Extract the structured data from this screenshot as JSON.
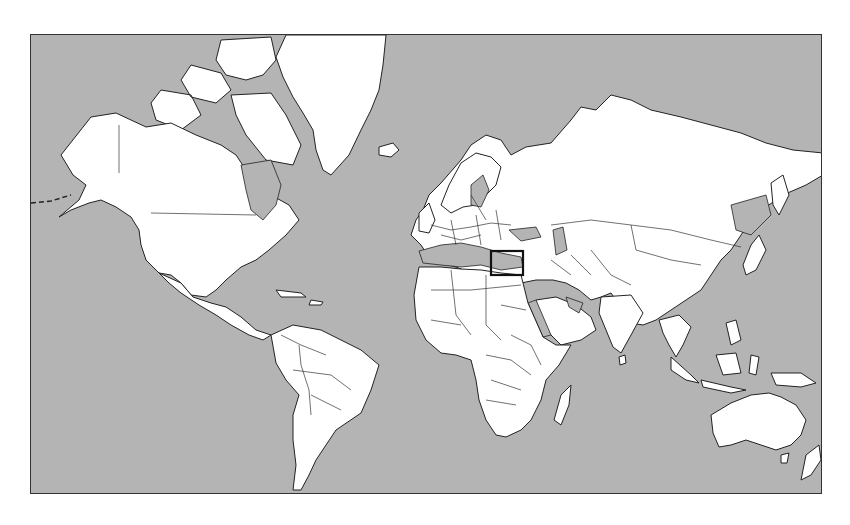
{
  "map": {
    "projection": "Mercator",
    "style": "outline world map, grey ocean, white land",
    "colors": {
      "ocean": "#b4b4b4",
      "land": "#ffffff",
      "outline": "#222222",
      "highlight_box": "#111111"
    },
    "highlight": {
      "region": "Eastern Mediterranean / Levant",
      "shape": "rectangle"
    },
    "regions": [
      "North America",
      "Greenland",
      "South America",
      "Europe",
      "Africa",
      "Asia",
      "Australia",
      "New Zealand",
      "Indonesia",
      "Japan",
      "Iceland",
      "Madagascar",
      "Caribbean"
    ]
  }
}
